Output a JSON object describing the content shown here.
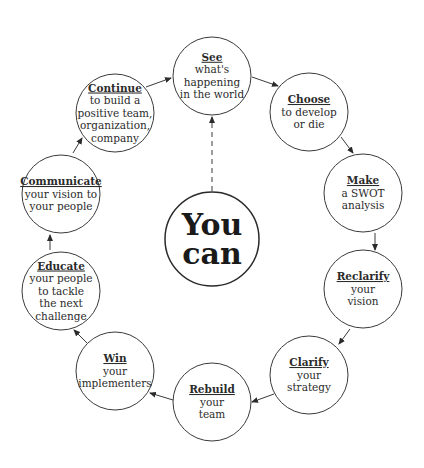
{
  "diagram": {
    "center": {
      "lines": [
        "You",
        "can"
      ],
      "cx": 212,
      "cy": 239,
      "r": 47
    },
    "nodes": [
      {
        "id": "see",
        "title": "See",
        "lines": [
          "what's",
          "happening",
          "in the world"
        ],
        "cx": 212,
        "cy": 76,
        "r": 39
      },
      {
        "id": "choose",
        "title": "Choose",
        "lines": [
          "to develop",
          "or die"
        ],
        "cx": 309,
        "cy": 112,
        "r": 39
      },
      {
        "id": "make",
        "title": "Make",
        "lines": [
          "a SWOT",
          "analysis"
        ],
        "cx": 363,
        "cy": 193,
        "r": 39
      },
      {
        "id": "reclarify",
        "title": "Reclarify",
        "lines": [
          "your",
          "vision"
        ],
        "cx": 363,
        "cy": 289,
        "r": 39
      },
      {
        "id": "clarify",
        "title": "Clarify",
        "lines": [
          "your",
          "strategy"
        ],
        "cx": 309,
        "cy": 375,
        "r": 39
      },
      {
        "id": "rebuild",
        "title": "Rebuild",
        "lines": [
          "your",
          "team"
        ],
        "cx": 212,
        "cy": 402,
        "r": 39
      },
      {
        "id": "win",
        "title": "Win",
        "lines": [
          "your",
          "implementers"
        ],
        "cx": 115,
        "cy": 371,
        "r": 39
      },
      {
        "id": "educate",
        "title": "Educate",
        "lines": [
          "your people",
          "to tackle",
          "the next",
          "challenge"
        ],
        "cx": 61,
        "cy": 291,
        "r": 39
      },
      {
        "id": "communicate",
        "title": "Communicate",
        "lines": [
          "your vision to",
          "your people"
        ],
        "cx": 61,
        "cy": 194,
        "r": 39
      },
      {
        "id": "continue",
        "title": "Continue",
        "lines": [
          "to build a",
          "positive team,",
          "organization,",
          "company"
        ],
        "cx": 115,
        "cy": 113,
        "r": 39
      }
    ],
    "arrows": [
      {
        "from": "see",
        "to": "choose",
        "x1": 252,
        "y1": 77,
        "x2": 278,
        "y2": 86
      },
      {
        "from": "choose",
        "to": "make",
        "x1": 341,
        "y1": 137,
        "x2": 353,
        "y2": 153
      },
      {
        "from": "make",
        "to": "reclarify",
        "x1": 375,
        "y1": 233,
        "x2": 375,
        "y2": 250
      },
      {
        "from": "reclarify",
        "to": "clarify",
        "x1": 350,
        "y1": 329,
        "x2": 339,
        "y2": 344
      },
      {
        "from": "clarify",
        "to": "rebuild",
        "x1": 274,
        "y1": 394,
        "x2": 252,
        "y2": 402
      },
      {
        "from": "rebuild",
        "to": "win",
        "x1": 173,
        "y1": 400,
        "x2": 150,
        "y2": 393
      },
      {
        "from": "win",
        "to": "educate",
        "x1": 87,
        "y1": 343,
        "x2": 74,
        "y2": 330
      },
      {
        "from": "educate",
        "to": "communicate",
        "x1": 50,
        "y1": 250,
        "x2": 50,
        "y2": 235
      },
      {
        "from": "communicate",
        "to": "continue",
        "x1": 73,
        "y1": 153,
        "x2": 82,
        "y2": 138
      },
      {
        "from": "continue",
        "to": "see",
        "x1": 146,
        "y1": 87,
        "x2": 171,
        "y2": 78
      }
    ],
    "dashed_arrow": {
      "from": "center",
      "to": "see",
      "x1": 212,
      "y1": 191,
      "x2": 212,
      "y2": 117
    }
  }
}
